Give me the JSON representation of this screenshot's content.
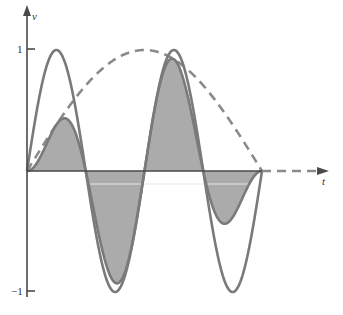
{
  "chart_data": {
    "type": "line",
    "title": "",
    "xlabel": "t",
    "ylabel": "v",
    "ylim": [
      -1,
      1
    ],
    "yticks": [
      {
        "value": 1,
        "label": "1"
      },
      {
        "value": -1,
        "label": "−1"
      }
    ],
    "grid": false,
    "legend": null,
    "t_range": [
      0,
      1
    ],
    "series": [
      {
        "name": "carrier",
        "formula": "sin(4*pi*t)",
        "style": "solid",
        "fill": false,
        "t": [
          0,
          0.0625,
          0.125,
          0.1875,
          0.25,
          0.3125,
          0.375,
          0.4375,
          0.5,
          0.5625,
          0.625,
          0.6875,
          0.75,
          0.8125,
          0.875,
          0.9375,
          1
        ],
        "values": [
          0,
          0.707,
          1,
          0.707,
          0,
          -0.707,
          -1,
          -0.707,
          0,
          0.707,
          1,
          0.707,
          0,
          -0.707,
          -1,
          -0.707,
          0
        ]
      },
      {
        "name": "envelope",
        "formula": "sin(pi*t)",
        "style": "dashed",
        "fill": false,
        "t": [
          0,
          0.0625,
          0.125,
          0.1875,
          0.25,
          0.3125,
          0.375,
          0.4375,
          0.5,
          0.5625,
          0.625,
          0.6875,
          0.75,
          0.8125,
          0.875,
          0.9375,
          1
        ],
        "values": [
          0,
          0.195,
          0.383,
          0.556,
          0.707,
          0.831,
          0.924,
          0.981,
          1,
          0.981,
          0.924,
          0.831,
          0.707,
          0.556,
          0.383,
          0.195,
          0
        ]
      },
      {
        "name": "product",
        "formula": "sin(4*pi*t)*sin(pi*t)",
        "style": "solid",
        "fill": true,
        "t": [
          0,
          0.0625,
          0.125,
          0.1875,
          0.25,
          0.3125,
          0.375,
          0.4375,
          0.5,
          0.5625,
          0.625,
          0.6875,
          0.75,
          0.8125,
          0.875,
          0.9375,
          1
        ],
        "values": [
          0,
          0.138,
          0.383,
          0.393,
          0,
          -0.588,
          -0.924,
          -0.694,
          0,
          0.694,
          0.924,
          0.588,
          0,
          -0.393,
          -0.383,
          -0.138,
          0
        ]
      }
    ],
    "annotations": [
      "dashed extension of t-axis beyond t=1"
    ]
  },
  "axes": {
    "x_label": "t",
    "y_label": "v",
    "tick_pos": "1",
    "tick_neg": "−1"
  },
  "colors": {
    "curve": "#7a7a7a",
    "fill": "#ababab",
    "axis": "#4a4a4a",
    "dash": "#8a8a8a"
  }
}
